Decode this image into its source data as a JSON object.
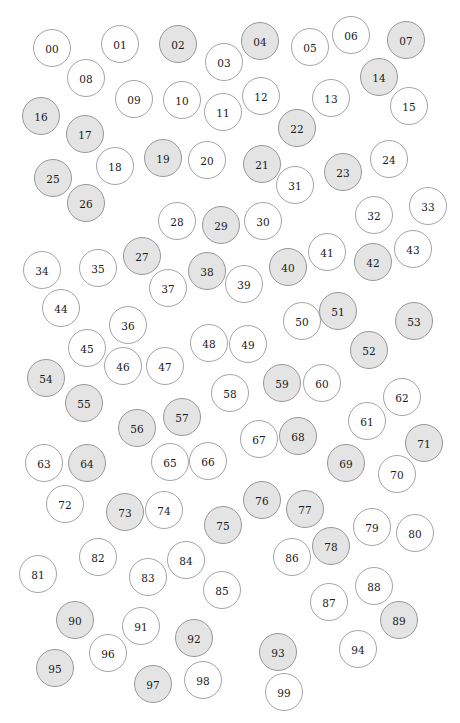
{
  "figure": {
    "width": 460,
    "height": 723,
    "background_color": "#ffffff",
    "label_color": "#1a1a1a",
    "label_font_size": 10.5
  },
  "styles": {
    "filled": {
      "fill_color": "#e4e4e4",
      "stroke_color": "#8c8c8c"
    },
    "empty": {
      "fill_color": "#ffffff",
      "stroke_color": "#9a9a9a"
    }
  },
  "chart_data": {
    "type": "scatter",
    "subtitle": "",
    "xlabel": "",
    "ylabel": "",
    "xlim": [
      0,
      460
    ],
    "ylim": [
      0,
      723
    ],
    "grid": false,
    "legend": null,
    "marker_shape": "circle",
    "point_count": 100,
    "series": [
      {
        "name": "filled",
        "fill": "#e4e4e4",
        "stroke": "#8c8c8c",
        "count": 40
      },
      {
        "name": "empty",
        "fill": "#ffffff",
        "stroke": "#9a9a9a",
        "count": 60
      }
    ],
    "points": [
      {
        "label": "00",
        "x": 52,
        "y": 48,
        "r": 18.5,
        "state": "empty"
      },
      {
        "label": "01",
        "x": 120,
        "y": 44,
        "r": 18.5,
        "state": "empty"
      },
      {
        "label": "02",
        "x": 178,
        "y": 44,
        "r": 18.5,
        "state": "filled"
      },
      {
        "label": "03",
        "x": 224,
        "y": 62,
        "r": 18.5,
        "state": "empty"
      },
      {
        "label": "04",
        "x": 260,
        "y": 41,
        "r": 18.5,
        "state": "filled"
      },
      {
        "label": "05",
        "x": 310,
        "y": 47,
        "r": 18.5,
        "state": "empty"
      },
      {
        "label": "06",
        "x": 351,
        "y": 35,
        "r": 18.5,
        "state": "empty"
      },
      {
        "label": "07",
        "x": 406,
        "y": 40,
        "r": 18.5,
        "state": "filled"
      },
      {
        "label": "08",
        "x": 86,
        "y": 78,
        "r": 18.5,
        "state": "empty"
      },
      {
        "label": "09",
        "x": 134,
        "y": 99,
        "r": 18.5,
        "state": "empty"
      },
      {
        "label": "10",
        "x": 182,
        "y": 100,
        "r": 18.5,
        "state": "empty"
      },
      {
        "label": "11",
        "x": 223,
        "y": 112,
        "r": 18.5,
        "state": "empty"
      },
      {
        "label": "12",
        "x": 261,
        "y": 96,
        "r": 18.5,
        "state": "empty"
      },
      {
        "label": "13",
        "x": 331,
        "y": 98,
        "r": 18.5,
        "state": "empty"
      },
      {
        "label": "14",
        "x": 379,
        "y": 77,
        "r": 18.5,
        "state": "filled"
      },
      {
        "label": "15",
        "x": 409,
        "y": 106,
        "r": 18.5,
        "state": "empty"
      },
      {
        "label": "16",
        "x": 41,
        "y": 116,
        "r": 18.5,
        "state": "filled"
      },
      {
        "label": "17",
        "x": 85,
        "y": 134,
        "r": 18.5,
        "state": "filled"
      },
      {
        "label": "18",
        "x": 115,
        "y": 166,
        "r": 18.5,
        "state": "empty"
      },
      {
        "label": "19",
        "x": 163,
        "y": 158,
        "r": 18.5,
        "state": "filled"
      },
      {
        "label": "20",
        "x": 207,
        "y": 160,
        "r": 18.5,
        "state": "empty"
      },
      {
        "label": "21",
        "x": 262,
        "y": 164,
        "r": 18.5,
        "state": "filled"
      },
      {
        "label": "22",
        "x": 297,
        "y": 128,
        "r": 18.5,
        "state": "filled"
      },
      {
        "label": "23",
        "x": 343,
        "y": 172,
        "r": 18.5,
        "state": "filled"
      },
      {
        "label": "24",
        "x": 389,
        "y": 159,
        "r": 18.5,
        "state": "empty"
      },
      {
        "label": "25",
        "x": 53,
        "y": 178,
        "r": 18.5,
        "state": "filled"
      },
      {
        "label": "26",
        "x": 86,
        "y": 203,
        "r": 18.5,
        "state": "filled"
      },
      {
        "label": "27",
        "x": 142,
        "y": 256,
        "r": 18.5,
        "state": "filled"
      },
      {
        "label": "28",
        "x": 177,
        "y": 221,
        "r": 18.5,
        "state": "empty"
      },
      {
        "label": "29",
        "x": 221,
        "y": 225,
        "r": 18.5,
        "state": "filled"
      },
      {
        "label": "30",
        "x": 263,
        "y": 221,
        "r": 18.5,
        "state": "empty"
      },
      {
        "label": "31",
        "x": 295,
        "y": 185,
        "r": 18.5,
        "state": "empty"
      },
      {
        "label": "32",
        "x": 374,
        "y": 215,
        "r": 18.5,
        "state": "empty"
      },
      {
        "label": "33",
        "x": 428,
        "y": 206,
        "r": 18.5,
        "state": "empty"
      },
      {
        "label": "34",
        "x": 42,
        "y": 270,
        "r": 18.5,
        "state": "empty"
      },
      {
        "label": "35",
        "x": 98,
        "y": 268,
        "r": 18.5,
        "state": "empty"
      },
      {
        "label": "36",
        "x": 128,
        "y": 325,
        "r": 18.5,
        "state": "empty"
      },
      {
        "label": "37",
        "x": 168,
        "y": 288,
        "r": 18.5,
        "state": "empty"
      },
      {
        "label": "38",
        "x": 207,
        "y": 271,
        "r": 18.5,
        "state": "filled"
      },
      {
        "label": "39",
        "x": 244,
        "y": 284,
        "r": 18.5,
        "state": "empty"
      },
      {
        "label": "40",
        "x": 288,
        "y": 267,
        "r": 18.5,
        "state": "filled"
      },
      {
        "label": "41",
        "x": 327,
        "y": 252,
        "r": 18.5,
        "state": "empty"
      },
      {
        "label": "42",
        "x": 373,
        "y": 262,
        "r": 18.5,
        "state": "filled"
      },
      {
        "label": "43",
        "x": 413,
        "y": 249,
        "r": 18.5,
        "state": "empty"
      },
      {
        "label": "44",
        "x": 61,
        "y": 308,
        "r": 18.5,
        "state": "empty"
      },
      {
        "label": "45",
        "x": 87,
        "y": 348,
        "r": 18.5,
        "state": "empty"
      },
      {
        "label": "46",
        "x": 123,
        "y": 366,
        "r": 18.5,
        "state": "empty"
      },
      {
        "label": "47",
        "x": 165,
        "y": 366,
        "r": 18.5,
        "state": "empty"
      },
      {
        "label": "48",
        "x": 209,
        "y": 343,
        "r": 18.5,
        "state": "empty"
      },
      {
        "label": "49",
        "x": 248,
        "y": 344,
        "r": 18.5,
        "state": "empty"
      },
      {
        "label": "50",
        "x": 302,
        "y": 321,
        "r": 18.5,
        "state": "empty"
      },
      {
        "label": "51",
        "x": 338,
        "y": 311,
        "r": 18.5,
        "state": "filled"
      },
      {
        "label": "52",
        "x": 369,
        "y": 350,
        "r": 18.5,
        "state": "filled"
      },
      {
        "label": "53",
        "x": 414,
        "y": 321,
        "r": 18.5,
        "state": "filled"
      },
      {
        "label": "54",
        "x": 46,
        "y": 378,
        "r": 18.5,
        "state": "filled"
      },
      {
        "label": "55",
        "x": 84,
        "y": 403,
        "r": 18.5,
        "state": "filled"
      },
      {
        "label": "56",
        "x": 137,
        "y": 428,
        "r": 18.5,
        "state": "filled"
      },
      {
        "label": "57",
        "x": 182,
        "y": 417,
        "r": 18.5,
        "state": "filled"
      },
      {
        "label": "58",
        "x": 230,
        "y": 393,
        "r": 18.5,
        "state": "empty"
      },
      {
        "label": "59",
        "x": 282,
        "y": 383,
        "r": 18.5,
        "state": "filled"
      },
      {
        "label": "60",
        "x": 322,
        "y": 383,
        "r": 18.5,
        "state": "empty"
      },
      {
        "label": "61",
        "x": 367,
        "y": 421,
        "r": 18.5,
        "state": "empty"
      },
      {
        "label": "62",
        "x": 402,
        "y": 397,
        "r": 18.5,
        "state": "empty"
      },
      {
        "label": "63",
        "x": 44,
        "y": 463,
        "r": 18.5,
        "state": "empty"
      },
      {
        "label": "64",
        "x": 87,
        "y": 463,
        "r": 18.5,
        "state": "filled"
      },
      {
        "label": "65",
        "x": 170,
        "y": 462,
        "r": 18.5,
        "state": "empty"
      },
      {
        "label": "66",
        "x": 208,
        "y": 461,
        "r": 18.5,
        "state": "empty"
      },
      {
        "label": "67",
        "x": 259,
        "y": 439,
        "r": 18.5,
        "state": "empty"
      },
      {
        "label": "68",
        "x": 298,
        "y": 436,
        "r": 18.5,
        "state": "filled"
      },
      {
        "label": "69",
        "x": 346,
        "y": 463,
        "r": 18.5,
        "state": "filled"
      },
      {
        "label": "70",
        "x": 397,
        "y": 474,
        "r": 18.5,
        "state": "empty"
      },
      {
        "label": "71",
        "x": 424,
        "y": 443,
        "r": 18.5,
        "state": "filled"
      },
      {
        "label": "72",
        "x": 65,
        "y": 504,
        "r": 18.5,
        "state": "empty"
      },
      {
        "label": "73",
        "x": 125,
        "y": 512,
        "r": 18.5,
        "state": "filled"
      },
      {
        "label": "74",
        "x": 164,
        "y": 510,
        "r": 18.5,
        "state": "empty"
      },
      {
        "label": "75",
        "x": 223,
        "y": 525,
        "r": 18.5,
        "state": "filled"
      },
      {
        "label": "76",
        "x": 262,
        "y": 500,
        "r": 18.5,
        "state": "filled"
      },
      {
        "label": "77",
        "x": 305,
        "y": 509,
        "r": 18.5,
        "state": "filled"
      },
      {
        "label": "78",
        "x": 331,
        "y": 546,
        "r": 18.5,
        "state": "filled"
      },
      {
        "label": "79",
        "x": 372,
        "y": 527,
        "r": 18.5,
        "state": "empty"
      },
      {
        "label": "80",
        "x": 415,
        "y": 533,
        "r": 18.5,
        "state": "empty"
      },
      {
        "label": "81",
        "x": 38,
        "y": 574,
        "r": 18.5,
        "state": "empty"
      },
      {
        "label": "82",
        "x": 98,
        "y": 557,
        "r": 18.5,
        "state": "empty"
      },
      {
        "label": "83",
        "x": 148,
        "y": 577,
        "r": 18.5,
        "state": "empty"
      },
      {
        "label": "84",
        "x": 186,
        "y": 560,
        "r": 18.5,
        "state": "empty"
      },
      {
        "label": "85",
        "x": 222,
        "y": 590,
        "r": 18.5,
        "state": "empty"
      },
      {
        "label": "86",
        "x": 292,
        "y": 557,
        "r": 18.5,
        "state": "empty"
      },
      {
        "label": "87",
        "x": 329,
        "y": 602,
        "r": 18.5,
        "state": "empty"
      },
      {
        "label": "88",
        "x": 374,
        "y": 586,
        "r": 18.5,
        "state": "empty"
      },
      {
        "label": "89",
        "x": 399,
        "y": 620,
        "r": 18.5,
        "state": "filled"
      },
      {
        "label": "90",
        "x": 75,
        "y": 620,
        "r": 18.5,
        "state": "filled"
      },
      {
        "label": "91",
        "x": 141,
        "y": 626,
        "r": 18.5,
        "state": "empty"
      },
      {
        "label": "92",
        "x": 194,
        "y": 638,
        "r": 18.5,
        "state": "filled"
      },
      {
        "label": "93",
        "x": 278,
        "y": 652,
        "r": 18.5,
        "state": "filled"
      },
      {
        "label": "94",
        "x": 358,
        "y": 649,
        "r": 18.5,
        "state": "empty"
      },
      {
        "label": "95",
        "x": 55,
        "y": 668,
        "r": 18.5,
        "state": "filled"
      },
      {
        "label": "96",
        "x": 108,
        "y": 653,
        "r": 18.5,
        "state": "empty"
      },
      {
        "label": "97",
        "x": 153,
        "y": 684,
        "r": 18.5,
        "state": "filled"
      },
      {
        "label": "98",
        "x": 203,
        "y": 680,
        "r": 18.5,
        "state": "empty"
      },
      {
        "label": "99",
        "x": 284,
        "y": 692,
        "r": 18.5,
        "state": "empty"
      }
    ]
  }
}
